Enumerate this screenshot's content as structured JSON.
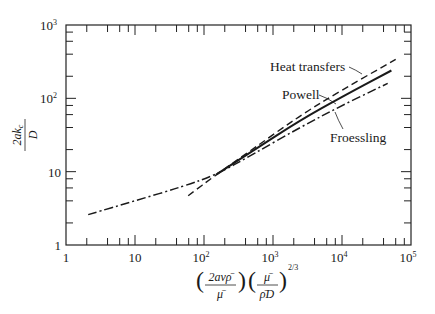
{
  "chart_data": {
    "type": "line",
    "title": "",
    "xlabel": "(2avρ̄/μ̄)(μ̄/ρ̄D)^(2/3)",
    "ylabel": "2ak_c/D",
    "xscale": "log",
    "yscale": "log",
    "xlim": [
      1,
      100000
    ],
    "ylim": [
      1,
      1000
    ],
    "x_ticks": [
      "1",
      "10",
      "10²",
      "10³",
      "10⁴",
      "10⁵"
    ],
    "y_ticks": [
      "1",
      "10",
      "10²",
      "10³"
    ],
    "grid": false,
    "legend": "inline annotations with leader lines",
    "series": [
      {
        "name": "Heat transfers",
        "style": "dashed",
        "x": [
          59,
          150,
          500,
          2450,
          10000,
          60000
        ],
        "y": [
          4.7,
          9.1,
          20,
          58,
          130,
          340
        ]
      },
      {
        "name": "Powell",
        "style": "solid",
        "x": [
          150,
          500,
          2450,
          10000,
          52000
        ],
        "y": [
          9.1,
          19,
          50,
          105,
          240
        ]
      },
      {
        "name": "Froessling",
        "style": "dash-dot",
        "x": [
          2.1,
          10,
          50,
          150,
          500,
          2450,
          10000,
          46000
        ],
        "y": [
          2.6,
          4.0,
          6.3,
          9.1,
          17,
          40,
          80,
          160
        ]
      }
    ]
  },
  "labels": {
    "heat": "Heat transfers",
    "powell": "Powell",
    "froessling": "Froessling",
    "x_ticks": {
      "t0": "1",
      "t1": "10",
      "t2": "10",
      "t2s": "2",
      "t3": "10",
      "t3s": "3",
      "t4": "10",
      "t4s": "4",
      "t5": "10",
      "t5s": "5"
    },
    "y_ticks": {
      "t0": "1",
      "t1": "10",
      "t2": "10",
      "t2s": "2",
      "t3": "10",
      "t3s": "3"
    },
    "ylabel": {
      "num": "2ak",
      "sub": "c",
      "den": "D"
    },
    "xlabel": {
      "num1": "2avρ̄",
      "den1": "μ̄",
      "num2": "μ̄",
      "den2": "ρ̄D",
      "exp": "2/3"
    }
  }
}
